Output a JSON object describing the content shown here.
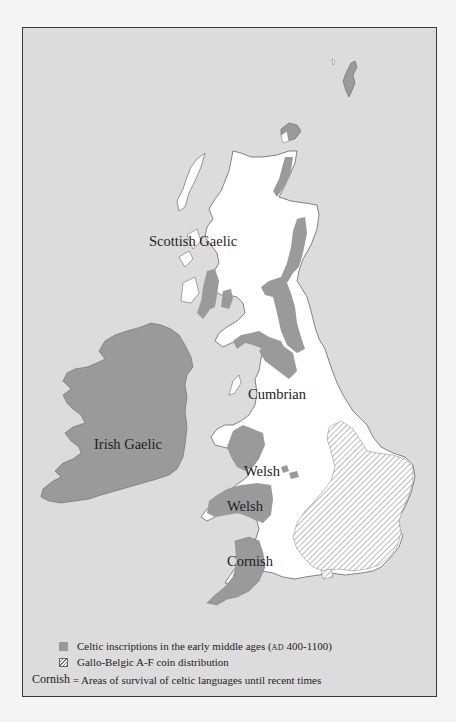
{
  "map": {
    "title": "Celtic languages in Britain and Ireland",
    "colors": {
      "sea": "#dcdcdc",
      "land": "#ffffff",
      "celtic_inscriptions": "#9a9a9a",
      "frame": "#3a3a3a",
      "hatch": "#777777"
    },
    "region_labels": [
      {
        "id": "scottish-gaelic",
        "text": "Scottish Gaelic"
      },
      {
        "id": "irish-gaelic",
        "text": "Irish Gaelic"
      },
      {
        "id": "cumbrian",
        "text": "Cumbrian"
      },
      {
        "id": "welsh-north",
        "text": "Welsh"
      },
      {
        "id": "welsh-south",
        "text": "Welsh"
      },
      {
        "id": "cornish",
        "text": "Cornish"
      }
    ]
  },
  "legend": {
    "items": [
      {
        "swatch": "grey-fill",
        "text": "Celtic inscriptions in the early middle ages (",
        "smallcaps": "AD",
        "suffix": " 400-1100)"
      },
      {
        "swatch": "hatched",
        "text": "Gallo-Belgic A-F coin distribution"
      }
    ],
    "label_key": {
      "example": "Cornish",
      "text": " = Areas of survival of celtic languages until recent times"
    }
  }
}
